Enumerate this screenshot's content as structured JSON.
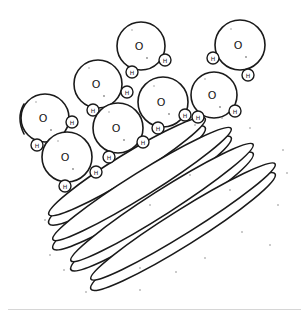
{
  "labels": {
    "oxygen": "O",
    "hydrogen": "H"
  },
  "molecule_count": 8,
  "pancake_count": 4,
  "colors": {
    "ink": "#1a1a1a",
    "background": "#ffffff",
    "speckle": "#8a8a8a",
    "rule": "#d6d6d6"
  }
}
